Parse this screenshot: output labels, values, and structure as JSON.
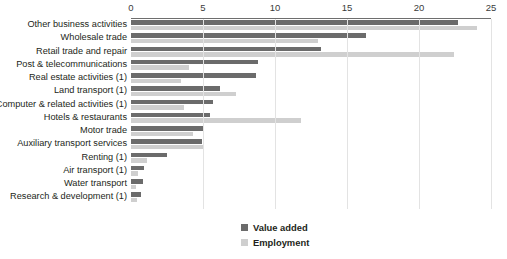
{
  "chart_data": {
    "type": "bar",
    "orientation": "horizontal",
    "title": "",
    "subtitle": "",
    "xlabel": "",
    "ylabel": "",
    "xlim": [
      0,
      25
    ],
    "xticks": [
      0,
      5,
      10,
      15,
      20,
      25
    ],
    "xtick_labels": [
      "0",
      "5",
      "10",
      "15",
      "20",
      "25"
    ],
    "grid": true,
    "grid_axis": "x",
    "legend_position": "bottom-right",
    "categories": [
      "Other business activities",
      "Wholesale trade",
      "Retail trade and repair",
      "Post & telecommunications",
      "Real estate activities (1)",
      "Land transport (1)",
      "Computer & related activities (1)",
      "Hotels & restaurants",
      "Motor trade",
      "Auxiliary transport services",
      "Renting (1)",
      "Air transport (1)",
      "Water transport",
      "Research & development (1)"
    ],
    "series": [
      {
        "name": "Value added",
        "color": "#6b6b6b",
        "values": [
          22.7,
          16.3,
          13.2,
          8.8,
          8.7,
          6.2,
          5.7,
          5.5,
          5.1,
          4.9,
          2.5,
          0.9,
          0.8,
          0.7
        ]
      },
      {
        "name": "Employment",
        "color": "#cfcfcf",
        "values": [
          24.0,
          13.0,
          22.4,
          4.0,
          3.5,
          7.3,
          3.7,
          11.8,
          4.3,
          5.1,
          1.1,
          0.5,
          0.35,
          0.45
        ]
      }
    ]
  },
  "legend": {
    "items": [
      {
        "label": "Value added",
        "color": "#6b6b6b"
      },
      {
        "label": "Employment",
        "color": "#cfcfcf"
      }
    ]
  }
}
